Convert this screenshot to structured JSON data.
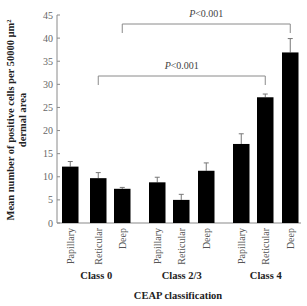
{
  "chart_data": {
    "type": "bar",
    "title": "",
    "xlabel": "CEAP classification",
    "ylabel_line1": "Mean number of positive cells per 50000 µm²",
    "ylabel_line2": "dermal area",
    "ylim": [
      0,
      45
    ],
    "yticks": [
      0,
      5,
      10,
      15,
      20,
      25,
      30,
      35,
      40,
      45
    ],
    "grid": false,
    "legend": null,
    "groups": [
      {
        "name": "Class 0",
        "categories": [
          "Papillary",
          "Reticular",
          "Deep"
        ],
        "values": [
          12.2,
          9.7,
          7.4
        ],
        "errors": [
          1.1,
          1.2,
          0.3
        ]
      },
      {
        "name": "Class 2/3",
        "categories": [
          "Papillary",
          "Reticular",
          "Deep"
        ],
        "values": [
          8.8,
          5.0,
          11.3
        ],
        "errors": [
          1.1,
          1.2,
          1.7
        ]
      },
      {
        "name": "Class 4",
        "categories": [
          "Papillary",
          "Reticular",
          "Deep"
        ],
        "values": [
          17.1,
          27.2,
          36.9
        ],
        "errors": [
          2.2,
          0.7,
          3.0
        ]
      }
    ],
    "annotations": [
      {
        "text": "P<0.001",
        "from": "Class 0 Deep",
        "to": "Class 4 Deep",
        "level": "upper"
      },
      {
        "text": "P<0.001",
        "from": "Class 0 Reticular",
        "to": "Class 4 Reticular",
        "level": "lower"
      }
    ],
    "colors": {
      "bar": "#000000",
      "axis": "#8a8a8a",
      "bracket": "#8a8a8a",
      "error": "#777777"
    }
  }
}
